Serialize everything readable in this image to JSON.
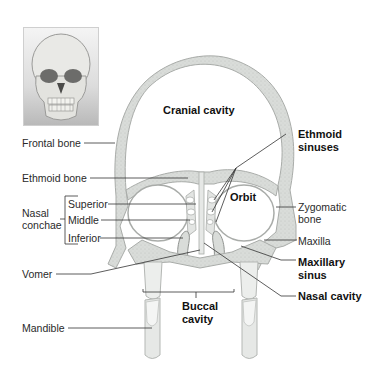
{
  "figure": {
    "photo": {
      "icon": "skull-photo-icon",
      "description": "Anterior view of human skull"
    },
    "region_labels": {
      "cranial_cavity": "Cranial cavity",
      "orbit": "Orbit",
      "buccal_cavity_line1": "Buccal",
      "buccal_cavity_line2": "cavity"
    },
    "left_labels": {
      "frontal_bone": "Frontal bone",
      "ethmoid_bone": "Ethmoid bone",
      "nasal_conchae_line1": "Nasal",
      "nasal_conchae_line2": "conchae",
      "superior": "Superior",
      "middle": "Middle",
      "inferior": "Inferior",
      "vomer": "Vomer",
      "mandible": "Mandible"
    },
    "right_labels": {
      "ethmoid_sinuses_line1": "Ethmoid",
      "ethmoid_sinuses_line2": "sinuses",
      "zygomatic_bone_line1": "Zygomatic",
      "zygomatic_bone_line2": "bone",
      "maxilla": "Maxilla",
      "maxillary_sinus_line1": "Maxillary",
      "maxillary_sinus_line2": "sinus",
      "nasal_cavity": "Nasal cavity"
    },
    "colors": {
      "bone_fill": "#d9dcd9",
      "bone_stroke": "#a9aca9",
      "tooth_fill": "#eceeec",
      "leader_line": "#333333",
      "label_text": "#2a2a2a"
    }
  }
}
